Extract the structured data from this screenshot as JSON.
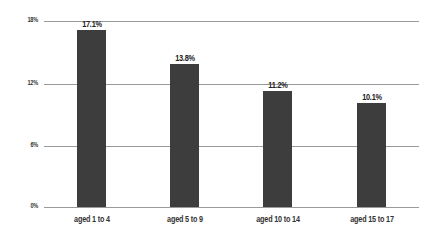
{
  "chart_data": {
    "type": "bar",
    "title": "",
    "xlabel": "",
    "ylabel": "",
    "categories": [
      "aged 1 to 4",
      "aged 5 to 9",
      "aged 10 to 14",
      "aged 15 to 17"
    ],
    "values": [
      17.1,
      13.8,
      11.2,
      10.1
    ],
    "value_labels": [
      "17.1%",
      "13.8%",
      "11.2%",
      "10.1%"
    ],
    "ylim": [
      0,
      18
    ],
    "yticks": [
      0,
      6,
      12,
      18
    ],
    "ytick_labels": [
      "0%",
      "6%",
      "12%",
      "18%"
    ],
    "grid": true,
    "legend": null,
    "bar_color": "#3d3d3d"
  }
}
